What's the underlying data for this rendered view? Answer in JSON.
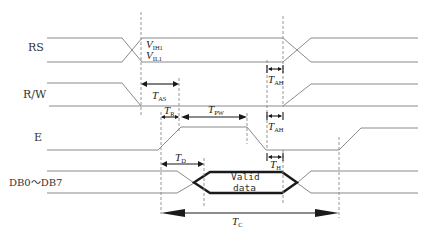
{
  "diagram": {
    "type": "timing-diagram",
    "signals": [
      {
        "name": "RS",
        "label": "RS"
      },
      {
        "name": "R/W",
        "label": "R/W"
      },
      {
        "name": "E",
        "label": "E"
      },
      {
        "name": "DB0~DB7",
        "label": "DB0～DB7"
      }
    ],
    "threshold_labels": {
      "vih": {
        "main": "V",
        "sub": "IH1"
      },
      "vil": {
        "main": "V",
        "sub": "IL1"
      }
    },
    "timing_params": {
      "tas": {
        "main": "T",
        "sub": "AS"
      },
      "tah_rs": {
        "main": "T",
        "sub": "AH"
      },
      "tah_rw": {
        "main": "T",
        "sub": "AH"
      },
      "tr": {
        "main": "T",
        "sub": "R"
      },
      "tpw": {
        "main": "T",
        "sub": "PW"
      },
      "th": {
        "main": "T",
        "sub": "H"
      },
      "td": {
        "main": "T",
        "sub": "D"
      },
      "tc": {
        "main": "T",
        "sub": "C"
      }
    },
    "data_window": {
      "line1": "Valid",
      "line2": "data"
    },
    "colors": {
      "signal": "#8a8a8a",
      "emphasis": "#1a1a1a",
      "background": "#ffffff"
    }
  }
}
